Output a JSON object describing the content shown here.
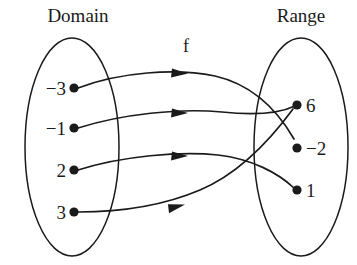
{
  "figure": {
    "type": "mapping-diagram",
    "domain_title": "Domain",
    "range_title": "Range",
    "function_label": "f"
  },
  "domain": {
    "title": "Domain",
    "elements": [
      {
        "label": "−3",
        "value": -3
      },
      {
        "label": "−1",
        "value": -1
      },
      {
        "label": "2",
        "value": 2
      },
      {
        "label": "3",
        "value": 3
      }
    ]
  },
  "range": {
    "title": "Range",
    "elements": [
      {
        "label": "6",
        "value": 6
      },
      {
        "label": "−2",
        "value": -2
      },
      {
        "label": "1",
        "value": 1
      }
    ]
  },
  "mappings": [
    {
      "from": "−3",
      "to": "−2"
    },
    {
      "from": "−1",
      "to": "6"
    },
    {
      "from": "2",
      "to": "1"
    },
    {
      "from": "3",
      "to": "6"
    }
  ],
  "colors": {
    "ink": "#1a1a1a",
    "background": "#ffffff"
  }
}
